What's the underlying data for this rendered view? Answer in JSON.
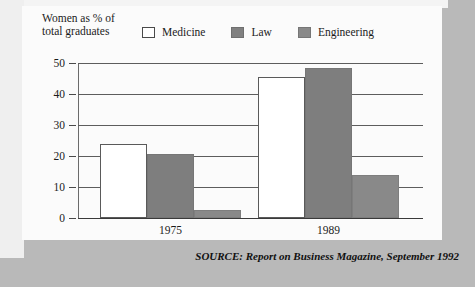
{
  "chart_data": {
    "type": "bar",
    "title": "",
    "ylabel": "Women as % of total graduates",
    "xlabel": "",
    "categories": [
      "1975",
      "1989"
    ],
    "series": [
      {
        "name": "Medicine",
        "values": [
          24,
          45.5
        ]
      },
      {
        "name": "Law",
        "values": [
          20.5,
          48.5
        ]
      },
      {
        "name": "Engineering",
        "values": [
          2.5,
          14
        ]
      }
    ],
    "ylim": [
      0,
      50
    ],
    "yticks": [
      0,
      10,
      20,
      30,
      40,
      50
    ],
    "ytick_labels": [
      "0",
      "10",
      "20",
      "30",
      "40",
      "50"
    ],
    "grid": true,
    "legend_position": "top",
    "colors": {
      "medicine": "#ffffff",
      "law": "#7e7e7e",
      "engineering": "#898989",
      "outline": "#5a5a5a",
      "background": "#fbfbfb",
      "figure_background": "#b9b9b9"
    }
  },
  "header": {
    "axis_title_line1": "Women as % of",
    "axis_title_line2": "total graduates"
  },
  "legend": {
    "items": [
      {
        "label": "Medicine"
      },
      {
        "label": "Law"
      },
      {
        "label": "Engineering"
      }
    ]
  },
  "axis": {
    "ticks": [
      {
        "label": "50"
      },
      {
        "label": "40"
      },
      {
        "label": "30"
      },
      {
        "label": "20"
      },
      {
        "label": "10"
      },
      {
        "label": "0"
      }
    ]
  },
  "groups": [
    {
      "label": "1975"
    },
    {
      "label": "1989"
    }
  ],
  "source": {
    "text": "SOURCE: Report on Business Magazine, September 1992"
  }
}
